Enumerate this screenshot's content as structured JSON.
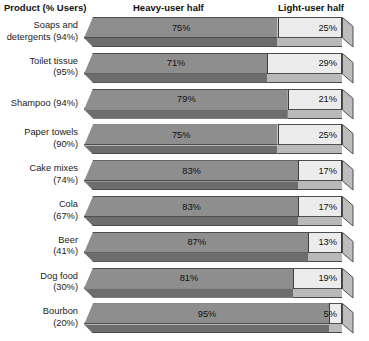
{
  "header": {
    "product_label": "Product (% Users)",
    "heavy_label": "Heavy-user half",
    "light_label": "Light-user half"
  },
  "colors": {
    "heavy_face": "#8e8e8e",
    "heavy_front": "#6d6d6d",
    "light_face": "#ececec",
    "light_front": "#b9b9b9",
    "cap": "#bdbdbd",
    "outline": "#4e4e4e",
    "background": "#ffffff",
    "text": "#1a1a1a"
  },
  "chart_data": {
    "type": "bar",
    "orientation": "horizontal",
    "stacked": true,
    "style": "3d",
    "title": "",
    "subtitle": "",
    "xlabel": "",
    "ylabel": "Product (% Users)",
    "xlim": [
      0,
      100
    ],
    "grid": false,
    "legend_position": "top",
    "categories": [
      "Soaps and detergents (94%)",
      "Toilet tissue (95%)",
      "Shampoo (94%)",
      "Paper towels (90%)",
      "Cake mixes (74%)",
      "Cola (67%)",
      "Beer (41%)",
      "Dog food (30%)",
      "Bourbon (20%)"
    ],
    "series": [
      {
        "name": "Heavy-user half",
        "values": [
          75,
          71,
          79,
          75,
          83,
          83,
          87,
          81,
          95
        ]
      },
      {
        "name": "Light-user half",
        "values": [
          25,
          29,
          21,
          25,
          17,
          17,
          13,
          19,
          5
        ]
      }
    ]
  },
  "rows": [
    {
      "label": "Soaps and\ndetergents (94%)",
      "product": "Soaps and detergents",
      "user_pct": "94%",
      "heavy": 75,
      "light": 25,
      "heavy_text": "75%",
      "light_text": "25%"
    },
    {
      "label": "Toilet tissue\n(95%)",
      "product": "Toilet tissue",
      "user_pct": "95%",
      "heavy": 71,
      "light": 29,
      "heavy_text": "71%",
      "light_text": "29%"
    },
    {
      "label": "Shampoo (94%)",
      "product": "Shampoo",
      "user_pct": "94%",
      "heavy": 79,
      "light": 21,
      "heavy_text": "79%",
      "light_text": "21%"
    },
    {
      "label": "Paper towels\n(90%)",
      "product": "Paper towels",
      "user_pct": "90%",
      "heavy": 75,
      "light": 25,
      "heavy_text": "75%",
      "light_text": "25%"
    },
    {
      "label": "Cake mixes\n(74%)",
      "product": "Cake mixes",
      "user_pct": "74%",
      "heavy": 83,
      "light": 17,
      "heavy_text": "83%",
      "light_text": "17%"
    },
    {
      "label": "Cola\n(67%)",
      "product": "Cola",
      "user_pct": "67%",
      "heavy": 83,
      "light": 17,
      "heavy_text": "83%",
      "light_text": "17%"
    },
    {
      "label": "Beer\n(41%)",
      "product": "Beer",
      "user_pct": "41%",
      "heavy": 87,
      "light": 13,
      "heavy_text": "87%",
      "light_text": "13%"
    },
    {
      "label": "Dog food\n(30%)",
      "product": "Dog food",
      "user_pct": "30%",
      "heavy": 81,
      "light": 19,
      "heavy_text": "81%",
      "light_text": "19%"
    },
    {
      "label": "Bourbon\n(20%)",
      "product": "Bourbon",
      "user_pct": "20%",
      "heavy": 95,
      "light": 5,
      "heavy_text": "95%",
      "light_text": "5%"
    }
  ]
}
